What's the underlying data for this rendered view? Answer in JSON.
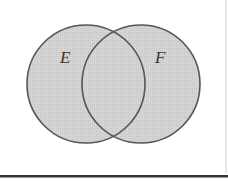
{
  "diagram": {
    "type": "venn",
    "sets": [
      {
        "label": "E",
        "cx": 86,
        "cy": 84,
        "r": 59
      },
      {
        "label": "F",
        "cx": 141,
        "cy": 84,
        "r": 59
      }
    ],
    "colors": {
      "fill": "#d2d2d2",
      "stroke": "#555555",
      "background": "#ffffff",
      "frame": "#c8c8c8",
      "rule": "#333333"
    }
  }
}
